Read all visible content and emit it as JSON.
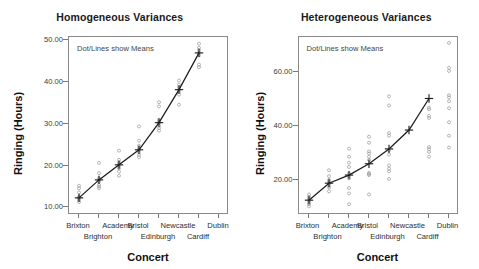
{
  "page": {
    "axis_label_x": "Concert",
    "axis_label_y": "Ringing (Hours)",
    "annotation": "Dot/Lines show Means",
    "colors": {
      "mean_line": "#1c1c1c",
      "point": "#9a9a9a",
      "frame": "#8a8a8a",
      "text": "#1a1a1a",
      "background": "#ffffff"
    }
  },
  "chart_data": [
    {
      "type": "scatter",
      "title": "Homogeneous Variances",
      "xlabel": "Concert",
      "ylabel": "Ringing (Hours)",
      "annotation": "Dot/Lines show Means",
      "grid": false,
      "legend": "none",
      "ylim": [
        8.2,
        50.8
      ],
      "yticks": [
        10,
        20,
        30,
        40,
        50
      ],
      "ytick_labels": [
        "10.00",
        "20.00",
        "30.00",
        "40.00",
        "50.00"
      ],
      "categories": [
        "Brixton",
        "Brighton",
        "Academy",
        "Bristol",
        "Edinburgh",
        "Newcastle",
        "Cardiff",
        "Dublin"
      ],
      "series": [
        {
          "name": "Means",
          "marker": "plus",
          "values": [
            12.3,
            16.6,
            20.2,
            23.8,
            30.3,
            38.2,
            47.0
          ],
          "note": "mean line plotted at 7 of the 8 tick positions (ticks 1-7)"
        }
      ],
      "points": [
        {
          "category": "Brixton",
          "values": [
            11.3,
            11.8,
            12.2,
            12.4,
            12.6,
            13.6,
            14.6,
            15.2
          ]
        },
        {
          "category": "Brighton",
          "values": [
            14.6,
            15.0,
            15.4,
            16.2,
            16.6,
            17.0,
            18.2,
            20.7
          ]
        },
        {
          "category": "Academy",
          "values": [
            17.6,
            18.6,
            19.4,
            20.0,
            20.4,
            20.8,
            21.4,
            23.6
          ]
        },
        {
          "category": "Bristol",
          "values": [
            22.0,
            22.6,
            23.2,
            23.8,
            24.2,
            24.8,
            26.0,
            29.4
          ]
        },
        {
          "category": "Edinburgh",
          "values": [
            28.4,
            29.0,
            29.6,
            30.2,
            30.6,
            31.0,
            34.2,
            35.2
          ]
        },
        {
          "category": "Newcastle",
          "values": [
            34.6,
            37.0,
            37.6,
            38.2,
            38.8,
            39.4,
            40.4
          ]
        },
        {
          "category": "Cardiff",
          "values": [
            43.6,
            44.2,
            46.4,
            47.0,
            47.6,
            48.2,
            49.2
          ]
        }
      ]
    },
    {
      "type": "scatter",
      "title": "Heterogeneous Variances",
      "xlabel": "Concert",
      "ylabel": "Ringing (Hours)",
      "annotation": "Dot/Lines show Means",
      "grid": false,
      "legend": "none",
      "ylim": [
        7.0,
        73.0
      ],
      "yticks": [
        20,
        40,
        60
      ],
      "ytick_labels": [
        "20.00",
        "40.00",
        "60.00"
      ],
      "categories": [
        "Brixton",
        "Brighton",
        "Academy",
        "Bristol",
        "Edinburgh",
        "Newcastle",
        "Cardiff",
        "Dublin"
      ],
      "series": [
        {
          "name": "Means",
          "marker": "plus",
          "values": [
            12.5,
            18.8,
            21.8,
            26.0,
            31.5,
            38.5,
            50.2
          ],
          "note": "mean line plotted at 7 of the 8 tick positions (ticks 1-7)"
        }
      ],
      "points": [
        {
          "category": "Brixton",
          "values": [
            10.2,
            11.0,
            11.6,
            12.3,
            13.0,
            13.8,
            14.6
          ]
        },
        {
          "category": "Brighton",
          "values": [
            15.8,
            17.2,
            18.0,
            18.6,
            19.2,
            20.0,
            21.4,
            23.6
          ]
        },
        {
          "category": "Academy",
          "values": [
            11.0,
            15.0,
            17.0,
            20.6,
            21.4,
            22.4,
            24.8,
            26.4,
            28.6,
            31.6
          ]
        },
        {
          "category": "Bristol",
          "values": [
            14.6,
            21.8,
            22.2,
            22.6,
            27.4,
            28.6,
            29.8,
            30.6,
            33.8,
            36.0
          ]
        },
        {
          "category": "Edinburgh",
          "values": [
            20.4,
            23.2,
            24.2,
            25.4,
            29.4,
            31.0,
            36.4,
            37.4,
            47.6,
            51.0
          ]
        },
        {
          "category": "Cardiff",
          "values": [
            28.6,
            30.4,
            31.4,
            32.2,
            43.0,
            43.8,
            46.2,
            46.8
          ]
        },
        {
          "category": "Dublin",
          "values": [
            32.0,
            36.4,
            41.4,
            46.6,
            49.2,
            50.6,
            51.4,
            60.4,
            61.6,
            70.8
          ]
        }
      ]
    }
  ]
}
